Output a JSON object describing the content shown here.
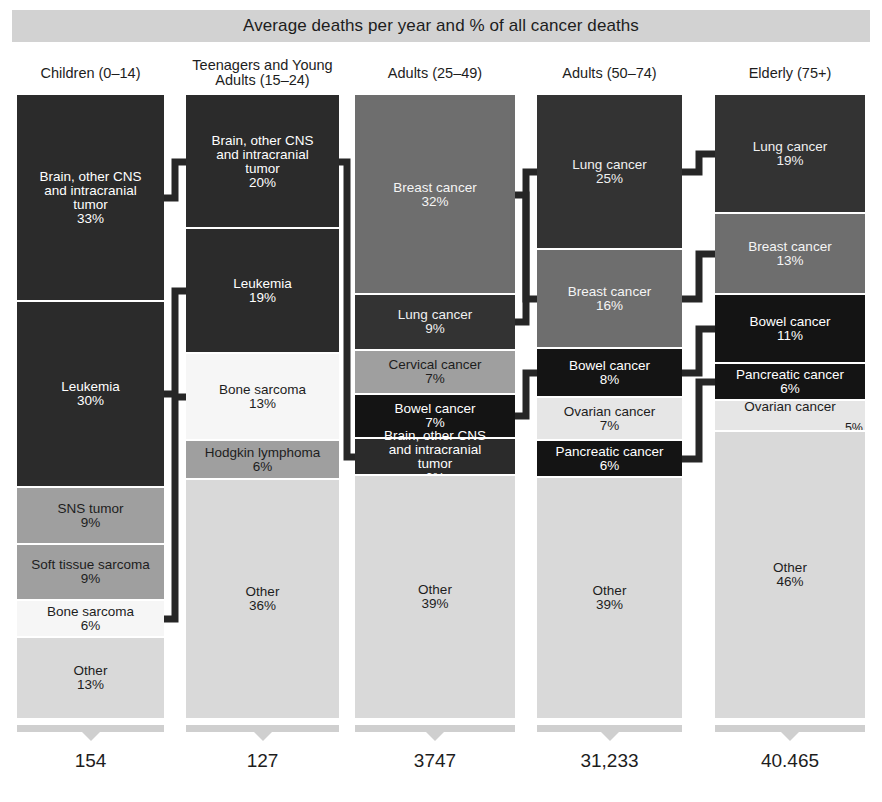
{
  "title": "Average deaths per year and % of all cancer deaths",
  "chart_data": {
    "type": "bar",
    "title": "Average deaths per year and % of all cancer deaths",
    "subtitle": "",
    "xlabel": "",
    "ylabel": "",
    "ylim": [
      0,
      100
    ],
    "grid": false,
    "legend_position": "none",
    "note": "Stacked 100% bar chart; each column is an age group. Segment values are % of all cancer deaths in that group. Column totals are average deaths per year.",
    "categories": [
      "Children (0–14)",
      "Teenagers and Young Adults (15–24)",
      "Adults (25–49)",
      "Adults (50–74)",
      "Elderly (75+)"
    ],
    "totals": [
      "154",
      "127",
      "3747",
      "31,233",
      "40.465"
    ],
    "columns": [
      {
        "header": "Children (0–14)",
        "header_lines": [
          "Children (0–14)"
        ],
        "total": "154",
        "segments": [
          {
            "label": "Brain, other CNS and intracranial tumor",
            "label_lines": [
              "Brain, other CNS",
              "and intracranial",
              "tumor"
            ],
            "pct": "33%",
            "value": 33,
            "tone": "tone-darkest"
          },
          {
            "label": "Leukemia",
            "label_lines": [
              "Leukemia"
            ],
            "pct": "30%",
            "value": 30,
            "tone": "tone-darkest"
          },
          {
            "label": "SNS tumor",
            "label_lines": [
              "SNS tumor"
            ],
            "pct": "9%",
            "value": 9,
            "tone": "tone-mid"
          },
          {
            "label": "Soft tissue sarcoma",
            "label_lines": [
              "Soft tissue sarcoma"
            ],
            "pct": "9%",
            "value": 9,
            "tone": "tone-mid"
          },
          {
            "label": "Bone sarcoma",
            "label_lines": [
              "Bone sarcoma"
            ],
            "pct": "6%",
            "value": 6,
            "tone": "tone-white"
          },
          {
            "label": "Other",
            "label_lines": [
              "Other"
            ],
            "pct": "13%",
            "value": 13,
            "tone": "tone-light"
          }
        ]
      },
      {
        "header": "Teenagers and Young Adults (15–24)",
        "header_lines": [
          "Teenagers and Young",
          "Adults (15–24)"
        ],
        "total": "127",
        "segments": [
          {
            "label": "Brain, other CNS and intracranial tumor",
            "label_lines": [
              "Brain, other CNS",
              "and intracranial",
              "tumor"
            ],
            "pct": "20%",
            "value": 20,
            "tone": "tone-darkest"
          },
          {
            "label": "Leukemia",
            "label_lines": [
              "Leukemia"
            ],
            "pct": "19%",
            "value": 19,
            "tone": "tone-darkest"
          },
          {
            "label": "Bone sarcoma",
            "label_lines": [
              "Bone sarcoma"
            ],
            "pct": "13%",
            "value": 13,
            "tone": "tone-white"
          },
          {
            "label": "Hodgkin lymphoma",
            "label_lines": [
              "Hodgkin lymphoma"
            ],
            "pct": "6%",
            "value": 6,
            "tone": "tone-mid"
          },
          {
            "label": "Other",
            "label_lines": [
              "Other"
            ],
            "pct": "36%",
            "value": 36,
            "tone": "tone-light"
          }
        ]
      },
      {
        "header": "Adults (25–49)",
        "header_lines": [
          "Adults (25–49)"
        ],
        "total": "3747",
        "segments": [
          {
            "label": "Breast cancer",
            "label_lines": [
              "Breast cancer"
            ],
            "pct": "32%",
            "value": 32,
            "tone": "tone-medium"
          },
          {
            "label": "Lung cancer",
            "label_lines": [
              "Lung cancer"
            ],
            "pct": "9%",
            "value": 9,
            "tone": "tone-dark"
          },
          {
            "label": "Cervical cancer",
            "label_lines": [
              "Cervical cancer"
            ],
            "pct": "7%",
            "value": 7,
            "tone": "tone-mid"
          },
          {
            "label": "Bowel cancer",
            "label_lines": [
              "Bowel cancer"
            ],
            "pct": "7%",
            "value": 7,
            "tone": "tone-black"
          },
          {
            "label": "Brain, other CNS and intracranial tumor",
            "label_lines": [
              "Brain, other CNS",
              "and intracranial",
              "tumor"
            ],
            "pct": "6%",
            "value": 6,
            "tone": "tone-darkest"
          },
          {
            "label": "Other",
            "label_lines": [
              "Other"
            ],
            "pct": "39%",
            "value": 39,
            "tone": "tone-light"
          }
        ]
      },
      {
        "header": "Adults (50–74)",
        "header_lines": [
          "Adults (50–74)"
        ],
        "total": "31,233",
        "segments": [
          {
            "label": "Lung cancer",
            "label_lines": [
              "Lung cancer"
            ],
            "pct": "25%",
            "value": 25,
            "tone": "tone-dark"
          },
          {
            "label": "Breast cancer",
            "label_lines": [
              "Breast cancer"
            ],
            "pct": "16%",
            "value": 16,
            "tone": "tone-medium"
          },
          {
            "label": "Bowel cancer",
            "label_lines": [
              "Bowel cancer"
            ],
            "pct": "8%",
            "value": 8,
            "tone": "tone-black"
          },
          {
            "label": "Ovarian cancer",
            "label_lines": [
              "Ovarian cancer"
            ],
            "pct": "7%",
            "value": 7,
            "tone": "tone-lighter"
          },
          {
            "label": "Pancreatic cancer",
            "label_lines": [
              "Pancreatic cancer"
            ],
            "pct": "6%",
            "value": 6,
            "tone": "tone-black"
          },
          {
            "label": "Other",
            "label_lines": [
              "Other"
            ],
            "pct": "39%",
            "value": 39,
            "tone": "tone-light"
          }
        ]
      },
      {
        "header": "Elderly (75+)",
        "header_lines": [
          "Elderly (75+)"
        ],
        "total": "40.465",
        "segments": [
          {
            "label": "Lung cancer",
            "label_lines": [
              "Lung cancer"
            ],
            "pct": "19%",
            "value": 19,
            "tone": "tone-dark"
          },
          {
            "label": "Breast cancer",
            "label_lines": [
              "Breast cancer"
            ],
            "pct": "13%",
            "value": 13,
            "tone": "tone-medium"
          },
          {
            "label": "Bowel cancer",
            "label_lines": [
              "Bowel cancer"
            ],
            "pct": "11%",
            "value": 11,
            "tone": "tone-black"
          },
          {
            "label": "Pancreatic cancer",
            "label_lines": [
              "Pancreatic cancer"
            ],
            "pct": "6%",
            "value": 6,
            "tone": "tone-black"
          },
          {
            "label": "Ovarian cancer",
            "label_lines": [
              "Ovarian cancer"
            ],
            "pct": "5%",
            "value": 5,
            "tone": "tone-lighter"
          },
          {
            "label": "Other",
            "label_lines": [
              "Other"
            ],
            "pct": "46%",
            "value": 46,
            "tone": "tone-light"
          }
        ]
      }
    ],
    "connections": [
      {
        "label": "Brain, other CNS and intracranial tumor",
        "from_col": 0,
        "from_seg": 0,
        "to_col": 1,
        "to_seg": 0
      },
      {
        "label": "Leukemia",
        "from_col": 0,
        "from_seg": 1,
        "to_col": 1,
        "to_seg": 1
      },
      {
        "label": "Bone sarcoma",
        "from_col": 0,
        "from_seg": 4,
        "to_col": 1,
        "to_seg": 2
      },
      {
        "label": "Brain, other CNS and intracranial tumor",
        "from_col": 1,
        "from_seg": 0,
        "to_col": 2,
        "to_seg": 4
      },
      {
        "label": "Breast cancer",
        "from_col": 2,
        "from_seg": 0,
        "to_col": 3,
        "to_seg": 1
      },
      {
        "label": "Lung cancer",
        "from_col": 2,
        "from_seg": 1,
        "to_col": 3,
        "to_seg": 0
      },
      {
        "label": "Bowel cancer",
        "from_col": 2,
        "from_seg": 3,
        "to_col": 3,
        "to_seg": 2
      },
      {
        "label": "Lung cancer",
        "from_col": 3,
        "from_seg": 0,
        "to_col": 4,
        "to_seg": 0
      },
      {
        "label": "Breast cancer",
        "from_col": 3,
        "from_seg": 1,
        "to_col": 4,
        "to_seg": 1
      },
      {
        "label": "Bowel cancer",
        "from_col": 3,
        "from_seg": 2,
        "to_col": 4,
        "to_seg": 2
      },
      {
        "label": "Pancreatic cancer",
        "from_col": 3,
        "from_seg": 4,
        "to_col": 4,
        "to_seg": 3
      }
    ]
  },
  "layout": {
    "col_x": [
      17,
      186,
      355,
      537,
      715
    ],
    "col_w": [
      147,
      153,
      160,
      145,
      150
    ],
    "stack_top": 95,
    "stack_bottom": 718,
    "header_y": [
      66,
      58,
      66,
      66,
      66
    ]
  }
}
